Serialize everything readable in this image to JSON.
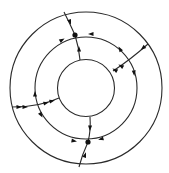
{
  "diagram": {
    "type": "concentric-circles-flow",
    "center": [
      86,
      88
    ],
    "circles": [
      {
        "name": "outer-circle",
        "r": 76
      },
      {
        "name": "middle-circle",
        "r": 51
      },
      {
        "name": "inner-circle",
        "r": 28.5
      }
    ],
    "nodes": [
      {
        "name": "node-top",
        "x": 75,
        "y": 35
      },
      {
        "name": "node-bottom",
        "x": 88,
        "y": 142
      }
    ],
    "edges": [
      {
        "name": "edge-top-outer",
        "d": "M64,12 Q70,24 75,35"
      },
      {
        "name": "edge-top-inner",
        "d": "M75,35 Q79,48 80,60"
      },
      {
        "name": "edge-right",
        "d": "M148,44 Q130,60 113,71"
      },
      {
        "name": "edge-left",
        "d": "M12,107 Q40,107 59,98"
      },
      {
        "name": "edge-bottom-inner",
        "d": "M90,117 Q91,130 88,142"
      },
      {
        "name": "edge-bottom-outer",
        "d": "M88,142 Q82,155 79,167"
      }
    ],
    "arrows": [
      {
        "name": "arrow-top-outer",
        "x": 70,
        "y": 22,
        "angle": 70
      },
      {
        "name": "arrow-top-inner",
        "x": 79,
        "y": 49,
        "angle": -92
      },
      {
        "name": "arrow-middle-topright",
        "x": 91,
        "y": 34,
        "angle": 180
      },
      {
        "name": "arrow-middle-topleft",
        "x": 62,
        "y": 40,
        "angle": -30
      },
      {
        "name": "arrow-right-outer",
        "x": 143,
        "y": 48,
        "angle": 140
      },
      {
        "name": "arrow-right-inner1",
        "x": 121,
        "y": 66,
        "angle": -150
      },
      {
        "name": "arrow-right-inner2",
        "x": 115,
        "y": 70,
        "angle": -150
      },
      {
        "name": "arrow-middle-right-upper",
        "x": 120,
        "y": 49,
        "angle": -120
      },
      {
        "name": "arrow-middle-right-lower",
        "x": 134,
        "y": 73,
        "angle": 85
      },
      {
        "name": "arrow-left-outer1",
        "x": 19,
        "y": 107,
        "angle": 0
      },
      {
        "name": "arrow-left-outer2",
        "x": 25,
        "y": 107,
        "angle": 0
      },
      {
        "name": "arrow-left-inner1",
        "x": 46,
        "y": 103,
        "angle": -15
      },
      {
        "name": "arrow-left-inner2",
        "x": 52,
        "y": 101,
        "angle": -15
      },
      {
        "name": "arrow-middle-left-upper",
        "x": 35,
        "y": 94,
        "angle": -90
      },
      {
        "name": "arrow-middle-left-lower",
        "x": 41,
        "y": 115,
        "angle": 60
      },
      {
        "name": "arrow-bottom-inner",
        "x": 90,
        "y": 128,
        "angle": 92
      },
      {
        "name": "arrow-bottom-outer",
        "x": 85,
        "y": 155,
        "angle": -70
      },
      {
        "name": "arrow-middle-bottom-left",
        "x": 74,
        "y": 141,
        "angle": 10
      },
      {
        "name": "arrow-middle-bottom-right",
        "x": 101,
        "y": 139,
        "angle": 165
      }
    ]
  }
}
